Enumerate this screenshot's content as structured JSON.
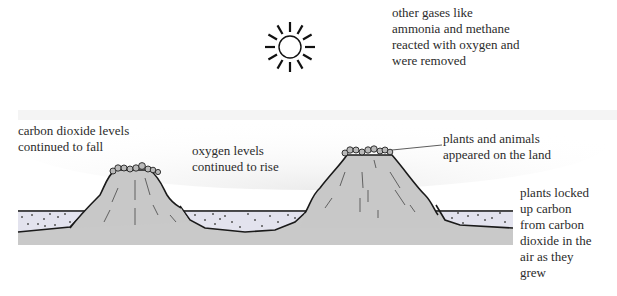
{
  "diagram": {
    "labels": {
      "gases": "other gases like\nammonia and methane\nreacted with oxygen and\nwere removed",
      "co2": "carbon dioxide levels\ncontinued to fall",
      "oxygen": "oxygen levels\ncontinued to rise",
      "plants_land": "plants and animals\nappeared on the land",
      "plants_carbon": "plants locked\nup carbon\nfrom carbon\ndioxide in the\nair as they\ngrew"
    },
    "icons": {
      "sun": "sun-icon"
    },
    "colors": {
      "land": "#c8c8c8",
      "sea": "#e4e4ee",
      "outline": "#1a1a1a",
      "atmosphere": "#f0f0f0",
      "text": "#2b2b2b"
    }
  }
}
